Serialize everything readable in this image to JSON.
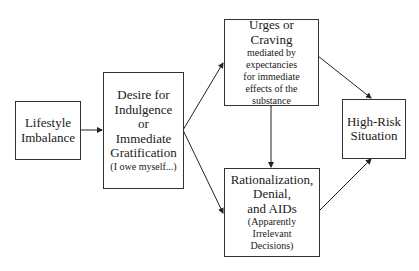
{
  "diagram": {
    "nodes": [
      {
        "id": "lifestyle",
        "main": [
          "Lifestyle",
          "Imbalance"
        ],
        "sub": []
      },
      {
        "id": "desire",
        "main": [
          "Desire for",
          "Indulgence",
          "or",
          "Immediate",
          "Gratification"
        ],
        "sub": [
          "(I owe myself...)"
        ]
      },
      {
        "id": "urges",
        "main": [
          "Urges or",
          "Craving"
        ],
        "sub": [
          "mediated by",
          "expectancies",
          "for immediate",
          "effects of the",
          "substance"
        ]
      },
      {
        "id": "rationalization",
        "main": [
          "Rationalization,",
          "Denial,",
          "and AIDs"
        ],
        "sub": [
          "(Apparently",
          "Irrelevant",
          "Decisions)"
        ]
      },
      {
        "id": "highrisk",
        "main": [
          "High-Risk",
          "Situation"
        ],
        "sub": []
      }
    ],
    "edges": [
      {
        "from": "lifestyle",
        "to": "desire"
      },
      {
        "from": "desire",
        "to": "urges"
      },
      {
        "from": "desire",
        "to": "rationalization"
      },
      {
        "from": "urges",
        "to": "rationalization",
        "bidirectional": true
      },
      {
        "from": "urges",
        "to": "highrisk"
      },
      {
        "from": "rationalization",
        "to": "highrisk"
      }
    ]
  }
}
